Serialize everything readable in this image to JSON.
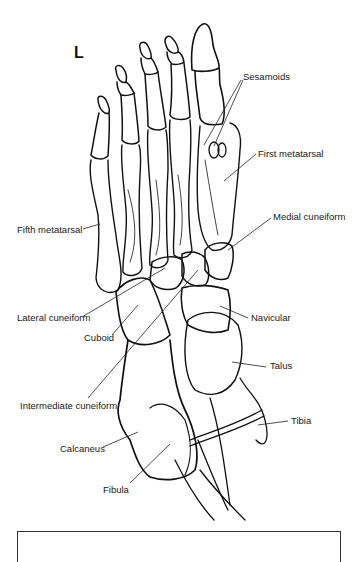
{
  "figure": {
    "side_marker": "L",
    "labels": [
      {
        "id": "sesamoids",
        "text": "Sesamoids",
        "x": 243,
        "y": 71
      },
      {
        "id": "first-metatarsal",
        "text": "First metatarsal",
        "x": 258,
        "y": 148
      },
      {
        "id": "fifth-metatarsal",
        "text": "Fifth metatarsal",
        "x": 17,
        "y": 224
      },
      {
        "id": "medial-cuneiform",
        "text": "Medial cuneiform",
        "x": 273,
        "y": 211
      },
      {
        "id": "lateral-cuneiform",
        "text": "Lateral cuneiform",
        "x": 17,
        "y": 312
      },
      {
        "id": "navicular",
        "text": "Navicular",
        "x": 251,
        "y": 312
      },
      {
        "id": "cuboid",
        "text": "Cuboid",
        "x": 84,
        "y": 332
      },
      {
        "id": "talus",
        "text": "Talus",
        "x": 270,
        "y": 360
      },
      {
        "id": "intermediate-cuneiform",
        "text": "Intermediate cuneiform",
        "x": 20,
        "y": 400
      },
      {
        "id": "tibia",
        "text": "Tibia",
        "x": 291,
        "y": 415
      },
      {
        "id": "calcaneus",
        "text": "Calcaneus",
        "x": 60,
        "y": 443
      },
      {
        "id": "fibula",
        "text": "Fibula",
        "x": 103,
        "y": 484
      }
    ],
    "caption_box": {
      "text": ""
    }
  }
}
